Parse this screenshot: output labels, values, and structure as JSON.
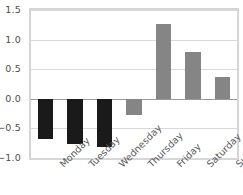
{
  "chart_data": {
    "type": "bar",
    "title": "",
    "subtitle": "",
    "xlabel": "",
    "ylabel": "",
    "categories": [
      "Monday",
      "Tuesday",
      "Wednesday",
      "Thursday",
      "Friday",
      "Saturday",
      "Sunday"
    ],
    "values": [
      -0.68,
      -0.76,
      -0.82,
      -0.27,
      1.27,
      0.79,
      0.36
    ],
    "bar_colors": [
      "#1a1a1a",
      "#1a1a1a",
      "#1a1a1a",
      "#858585",
      "#858585",
      "#858585",
      "#858585"
    ],
    "ylim": [
      -1.0,
      1.5
    ],
    "yticks": [
      1.5,
      1.0,
      0.5,
      0.0,
      -0.5,
      -1.0
    ],
    "ytick_labels": [
      "1.5",
      "1.0",
      "0.5",
      "0.0",
      "−0.5",
      "−1.0"
    ],
    "grid": true,
    "grid_axis": "y",
    "legend": null,
    "xtick_rotation": -45,
    "series": [
      {
        "name": "value",
        "values": [
          -0.68,
          -0.76,
          -0.82,
          -0.27,
          1.27,
          0.79,
          0.36
        ]
      }
    ],
    "colors": {
      "negative_dark": "#1a1a1a",
      "gray": "#858585",
      "gridline": "#d9d9d9",
      "zero_line": "#9a9a9a",
      "frame": "#d5d5d5",
      "tick_text": "#4d4d4d",
      "background": "#ffffff"
    }
  }
}
